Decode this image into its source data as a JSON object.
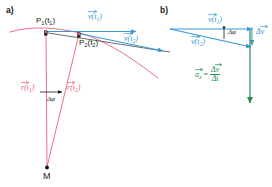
{
  "figure": {
    "width": 272,
    "height": 187,
    "background": "#ffffff",
    "colors": {
      "trajectory_red": "#e8607a",
      "radius_vector_red": "#e8607a",
      "velocity_blue": "#3a97d4",
      "acceleration_green": "#2e8b4f",
      "text_black": "#1a1a1a",
      "point_marker": "#1a1a1a"
    }
  },
  "panels": {
    "a": {
      "label": "a)",
      "points": [
        {
          "name": "P1",
          "label_main": "P",
          "label_sub": "1",
          "label_arg": "(t",
          "label_arg_sub": "1",
          "label_close": ")",
          "full": "P₁(t₁)"
        },
        {
          "name": "P2",
          "label_main": "P",
          "label_sub": "2",
          "label_arg": "(t",
          "label_arg_sub": "2",
          "label_close": ")",
          "full": "P₂(t₂)"
        }
      ],
      "vectors": {
        "v1": {
          "glyph": "v",
          "sub": "1",
          "full": "v⃗(t₁)",
          "color": "#3a97d4"
        },
        "v2": {
          "glyph": "v",
          "sub": "2",
          "full": "v⃗(t₂)",
          "color": "#3a97d4"
        },
        "r1": {
          "glyph": "r",
          "sub": "1",
          "full": "r⃗(t₁)",
          "color": "#e8607a"
        },
        "r2": {
          "glyph": "r",
          "sub": "2",
          "full": "r⃗(t₂)",
          "color": "#e8607a"
        }
      },
      "angle_label": "Δφ",
      "center_label": "M"
    },
    "b": {
      "label": "b)",
      "vectors": {
        "v1": {
          "glyph": "v",
          "sub": "1",
          "full": "v⃗(t₁)",
          "color": "#3a97d4"
        },
        "v2": {
          "glyph": "v",
          "sub": "2",
          "full": "v⃗(t₂)",
          "color": "#3a97d4"
        },
        "dv": {
          "glyph": "v",
          "prefix": "Δ",
          "full": "Δv⃗",
          "color": "#3a97d4"
        }
      },
      "angle_label": "Δφ",
      "acceleration": {
        "symbol_glyph": "a",
        "symbol_sub": "z",
        "equals": "=",
        "numerator_prefix": "Δ",
        "numerator_glyph": "v",
        "denominator_prefix": "Δ",
        "denominator_glyph": "t",
        "full": "a⃗z = Δv⃗ / Δt",
        "color": "#2e8b4f"
      }
    }
  }
}
